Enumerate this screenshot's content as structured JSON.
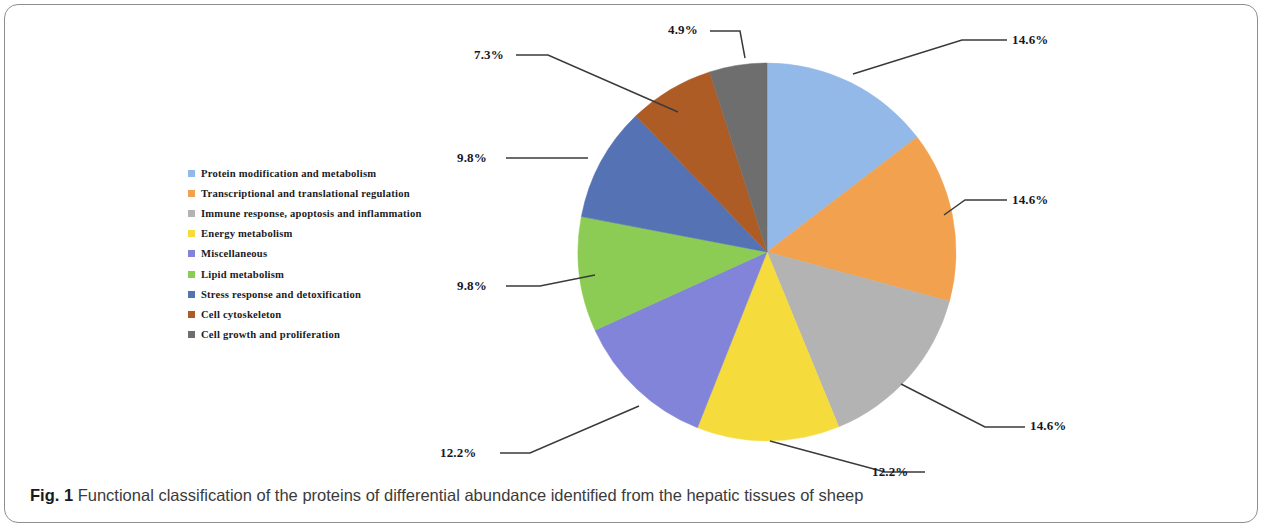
{
  "figure": {
    "caption_figno": "Fig. 1",
    "caption_text": " Functional classification of the proteins of differential abundance identified from the hepatic tissues of sheep"
  },
  "chart_data": {
    "type": "pie",
    "title": "",
    "subtitle": "",
    "xlabel": "",
    "ylabel": "",
    "legend_position": "left",
    "grid": false,
    "start_angle_deg": 0,
    "direction": "clockwise",
    "categories": [
      "Protein modification and metabolism",
      "Transcriptional and translational regulation",
      "Immune response, apoptosis and inflammation",
      "Energy metabolism",
      "Miscellaneous",
      "Lipid metabolism",
      "Stress response and detoxification",
      "Cell cytoskeleton",
      "Cell growth and proliferation"
    ],
    "values": [
      14.6,
      14.6,
      14.6,
      12.2,
      12.2,
      9.8,
      9.8,
      7.3,
      4.9
    ],
    "value_labels": [
      "14.6%",
      "14.6%",
      "14.6%",
      "12.2%",
      "12.2%",
      "9.8%",
      "9.8%",
      "7.3%",
      "4.9%"
    ],
    "colors": [
      "#93b9e8",
      "#f2a14f",
      "#b3b3b3",
      "#f5dc3c",
      "#8184d8",
      "#8ccb54",
      "#5573b4",
      "#ae5c26",
      "#6e6e6e"
    ],
    "unit": "%"
  },
  "legend": {
    "items": [
      {
        "label": "Protein modification and metabolism",
        "color": "#93b9e8"
      },
      {
        "label": "Transcriptional and translational regulation",
        "color": "#f2a14f"
      },
      {
        "label": "Immune response, apoptosis and inflammation",
        "color": "#b3b3b3"
      },
      {
        "label": "Energy metabolism",
        "color": "#f5dc3c"
      },
      {
        "label": "Miscellaneous",
        "color": "#8184d8"
      },
      {
        "label": "Lipid metabolism",
        "color": "#8ccb54"
      },
      {
        "label": "Stress response and detoxification",
        "color": "#5573b4"
      },
      {
        "label": "Cell cytoskeleton",
        "color": "#ae5c26"
      },
      {
        "label": "Cell growth and proliferation",
        "color": "#6e6e6e"
      }
    ]
  },
  "callouts": {
    "items": [
      {
        "text": "14.6%",
        "left": 1012,
        "top": 32
      },
      {
        "text": "14.6%",
        "left": 1012,
        "top": 192
      },
      {
        "text": "14.6%",
        "left": 1030,
        "top": 418
      },
      {
        "text": "12.2%",
        "left": 872,
        "top": 466
      },
      {
        "text": "12.2%",
        "left": 440,
        "top": 446
      },
      {
        "text": "9.8%",
        "left": 457,
        "top": 278
      },
      {
        "text": "9.8%",
        "left": 457,
        "top": 150
      },
      {
        "text": "7.3%",
        "left": 474,
        "top": 46
      },
      {
        "text": "4.9%",
        "left": 668,
        "top": 22
      }
    ]
  }
}
